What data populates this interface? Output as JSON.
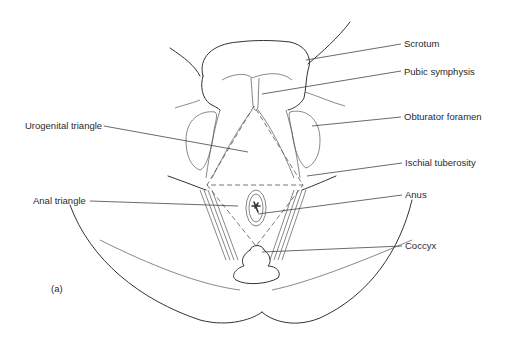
{
  "figure": {
    "panel_label": "(a)",
    "labels": {
      "scrotum": "Scrotum",
      "pubic_symphysis": "Pubic symphysis",
      "obturator_foramen": "Obturator foramen",
      "urogenital_triangle": "Urogenital triangle",
      "ischial_tuberosity": "Ischial tuberosity",
      "anal_triangle": "Anal triangle",
      "anus": "Anus",
      "coccyx": "Coccyx"
    }
  }
}
